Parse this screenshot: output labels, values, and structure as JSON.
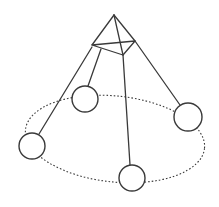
{
  "diagram": {
    "title": "",
    "background": "#ffffff",
    "stroke_color": "#3a3a3a",
    "apex": {
      "x": 114,
      "y": 15
    },
    "pyramid_base": [
      {
        "name": "left",
        "x": 92,
        "y": 45
      },
      {
        "name": "front",
        "x": 123,
        "y": 55
      },
      {
        "name": "right",
        "x": 135,
        "y": 41
      }
    ],
    "orbit_ellipse": {
      "cx": 115,
      "cy": 139,
      "rx": 90,
      "ry": 43,
      "rotation": 6,
      "style": "dotted"
    },
    "nodes": [
      {
        "name": "node-back",
        "cx": 85,
        "cy": 99,
        "r": 13
      },
      {
        "name": "node-left",
        "cx": 32,
        "cy": 146,
        "r": 13
      },
      {
        "name": "node-right",
        "cx": 188,
        "cy": 117,
        "r": 14
      },
      {
        "name": "node-front",
        "cx": 132,
        "cy": 178,
        "r": 13
      }
    ],
    "strings": [
      {
        "name": "string-left",
        "x1": 92,
        "y1": 47,
        "x2": 39,
        "y2": 134
      },
      {
        "name": "string-back",
        "x1": 101,
        "y1": 49,
        "x2": 88,
        "y2": 86
      },
      {
        "name": "string-front",
        "x1": 123,
        "y1": 55,
        "x2": 130,
        "y2": 165
      },
      {
        "name": "string-right",
        "x1": 135,
        "y1": 41,
        "x2": 180,
        "y2": 105
      }
    ]
  }
}
